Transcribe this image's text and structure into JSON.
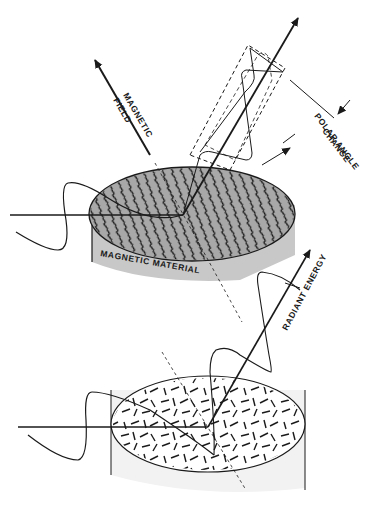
{
  "figure": {
    "colors": {
      "ink": "#1a1a1a",
      "magnetized_fill": "#a8a8a8",
      "side_fill": "#c8c8c8",
      "unmagnetized_fill": "#f2f2f2",
      "background": "#ffffff"
    }
  },
  "labels": {
    "magnetic": "MAGNETIC",
    "field": "FIELD",
    "polar_angle": "POLAR ANGLE",
    "change": "CHANGE",
    "magnetic_material": "MAGNETIC MATERIAL",
    "radiant_energy": "RADIANT ENERGY"
  },
  "panels": [
    {
      "name": "top",
      "state": "magnetized",
      "domain_pattern": "aligned"
    },
    {
      "name": "bottom",
      "state": "unmagnetized",
      "domain_pattern": "random"
    }
  ]
}
